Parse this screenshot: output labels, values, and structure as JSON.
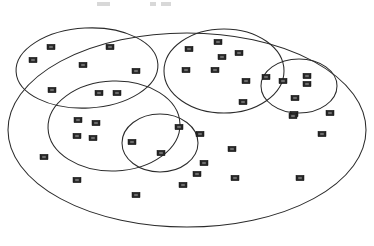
{
  "figure": {
    "title": "",
    "type": "cluster-ellipse-diagram",
    "canvas": {
      "width": 374,
      "height": 246
    },
    "background_color": "#ffffff",
    "stroke_color": "#2b2b2b",
    "marker_color": "#262626",
    "marker_core_color": "#6e6e6e"
  },
  "caption_fragment": {
    "visible": true,
    "description": "faint cropped gray marks at top edge of image",
    "segments": [
      {
        "x": 97,
        "y": 2,
        "width": 13,
        "height": 4
      },
      {
        "x": 150,
        "y": 2,
        "width": 6,
        "height": 4
      },
      {
        "x": 161,
        "y": 2,
        "width": 10,
        "height": 4
      }
    ]
  },
  "chart_data": {
    "type": "scatter",
    "title": "",
    "xlabel": "",
    "ylabel": "",
    "grid": false,
    "legend": "none",
    "xlim": [
      0,
      374
    ],
    "ylim": [
      0,
      246
    ],
    "note": "Nested/overlapping ellipse cluster diagram; points are small dark rectangular markers.",
    "ellipses": [
      {
        "name": "outer-universe-ellipse",
        "label": "",
        "cx": 187.0,
        "cy": 130.0,
        "rx": 179.0,
        "ry": 97.0,
        "rotation": 0
      },
      {
        "name": "cluster-ellipse-top-left",
        "label": "",
        "cx": 87.0,
        "cy": 68.0,
        "rx": 71.0,
        "ry": 40.0,
        "rotation": -3
      },
      {
        "name": "cluster-ellipse-mid-left",
        "label": "",
        "cx": 114.0,
        "cy": 126.0,
        "rx": 66.0,
        "ry": 45.0,
        "rotation": -2
      },
      {
        "name": "cluster-ellipse-top-middle",
        "label": "",
        "cx": 224.0,
        "cy": 71.0,
        "rx": 60.0,
        "ry": 42.0,
        "rotation": 0
      },
      {
        "name": "cluster-ellipse-right-small",
        "label": "",
        "cx": 299.0,
        "cy": 86.0,
        "rx": 38.0,
        "ry": 27.0,
        "rotation": 0
      },
      {
        "name": "cluster-ellipse-bottom-middle",
        "label": "",
        "cx": 160.0,
        "cy": 143.0,
        "rx": 38.0,
        "ry": 29.0,
        "rotation": 0
      }
    ],
    "points": [
      {
        "x": 51,
        "y": 47
      },
      {
        "x": 33,
        "y": 60
      },
      {
        "x": 110,
        "y": 47
      },
      {
        "x": 83,
        "y": 65
      },
      {
        "x": 136,
        "y": 71
      },
      {
        "x": 52,
        "y": 90
      },
      {
        "x": 99,
        "y": 93
      },
      {
        "x": 117,
        "y": 93
      },
      {
        "x": 189,
        "y": 49
      },
      {
        "x": 218,
        "y": 42
      },
      {
        "x": 222,
        "y": 57
      },
      {
        "x": 239,
        "y": 53
      },
      {
        "x": 186,
        "y": 70
      },
      {
        "x": 215,
        "y": 70
      },
      {
        "x": 246,
        "y": 81
      },
      {
        "x": 266,
        "y": 77
      },
      {
        "x": 283,
        "y": 81
      },
      {
        "x": 307,
        "y": 76
      },
      {
        "x": 307,
        "y": 84
      },
      {
        "x": 243,
        "y": 102
      },
      {
        "x": 295,
        "y": 98
      },
      {
        "x": 294,
        "y": 114
      },
      {
        "x": 330,
        "y": 113
      },
      {
        "x": 78,
        "y": 120
      },
      {
        "x": 96,
        "y": 123
      },
      {
        "x": 77,
        "y": 136
      },
      {
        "x": 93,
        "y": 138
      },
      {
        "x": 132,
        "y": 142
      },
      {
        "x": 44,
        "y": 157
      },
      {
        "x": 77,
        "y": 180
      },
      {
        "x": 136,
        "y": 195
      },
      {
        "x": 179,
        "y": 127
      },
      {
        "x": 200,
        "y": 134
      },
      {
        "x": 161,
        "y": 153
      },
      {
        "x": 322,
        "y": 134
      },
      {
        "x": 232,
        "y": 149
      },
      {
        "x": 204,
        "y": 163
      },
      {
        "x": 197,
        "y": 174
      },
      {
        "x": 235,
        "y": 178
      },
      {
        "x": 300,
        "y": 178
      },
      {
        "x": 183,
        "y": 185
      },
      {
        "x": 293,
        "y": 116
      }
    ]
  }
}
